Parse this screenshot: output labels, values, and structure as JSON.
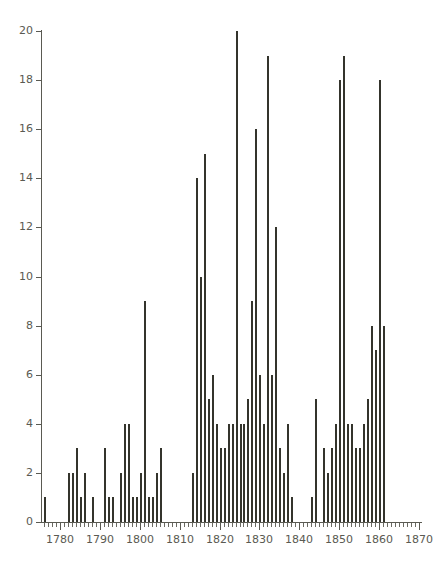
{
  "chart_data": {
    "type": "bar",
    "title": "",
    "subtitle": "",
    "xlabel": "",
    "ylabel": "",
    "xlim": [
      1775,
      1869
    ],
    "ylim": [
      0,
      20
    ],
    "grid": false,
    "legend": null,
    "bar_color": "#34342c",
    "axis_color": "#5a5a52",
    "background": "#ffffff",
    "x_tick_labels": [
      "1780",
      "1790",
      "1800",
      "1810",
      "1820",
      "1830",
      "1840",
      "1850",
      "1860",
      "1870"
    ],
    "x_tick_values": [
      1780,
      1790,
      1800,
      1810,
      1820,
      1830,
      1840,
      1850,
      1860,
      1870
    ],
    "x_minor_tick_step": 1,
    "y_tick_labels": [
      "0",
      "2",
      "4",
      "6",
      "8",
      "10",
      "12",
      "14",
      "16",
      "18",
      "20"
    ],
    "y_tick_values": [
      0,
      2,
      4,
      6,
      8,
      10,
      12,
      14,
      16,
      18,
      20
    ],
    "categories": [
      1776,
      1777,
      1778,
      1779,
      1780,
      1781,
      1782,
      1783,
      1784,
      1785,
      1786,
      1787,
      1788,
      1789,
      1790,
      1791,
      1792,
      1793,
      1794,
      1795,
      1796,
      1797,
      1798,
      1799,
      1800,
      1801,
      1802,
      1803,
      1804,
      1805,
      1806,
      1807,
      1808,
      1809,
      1810,
      1811,
      1812,
      1813,
      1814,
      1815,
      1816,
      1817,
      1818,
      1819,
      1820,
      1821,
      1822,
      1823,
      1824,
      1825,
      1826,
      1827,
      1828,
      1829,
      1830,
      1831,
      1832,
      1833,
      1834,
      1835,
      1836,
      1837,
      1838,
      1839,
      1840,
      1841,
      1842,
      1843,
      1844,
      1845,
      1846,
      1847,
      1848,
      1849,
      1850,
      1851,
      1852,
      1853,
      1854,
      1855,
      1856,
      1857,
      1858,
      1859,
      1860,
      1861,
      1862,
      1863,
      1864,
      1865,
      1866,
      1867
    ],
    "values": [
      1,
      0,
      0,
      0,
      0,
      0,
      2,
      2,
      3,
      1,
      2,
      0,
      1,
      0,
      0,
      3,
      1,
      1,
      0,
      2,
      4,
      4,
      1,
      1,
      2,
      9,
      1,
      1,
      2,
      3,
      0,
      0,
      0,
      0,
      0,
      0,
      0,
      2,
      14,
      10,
      15,
      5,
      6,
      4,
      3,
      3,
      4,
      4,
      20,
      4,
      4,
      5,
      9,
      16,
      6,
      4,
      19,
      6,
      12,
      3,
      2,
      4,
      1,
      0,
      0,
      0,
      0,
      1,
      5,
      0,
      3,
      2,
      3,
      4,
      18,
      19,
      4,
      4,
      3,
      3,
      4,
      5,
      8,
      7,
      18,
      8,
      0,
      0,
      0,
      0,
      0,
      0
    ],
    "series": [
      {
        "name": "count",
        "values": [
          1,
          0,
          0,
          0,
          0,
          0,
          2,
          2,
          3,
          1,
          2,
          0,
          1,
          0,
          0,
          3,
          1,
          1,
          0,
          2,
          4,
          4,
          1,
          1,
          2,
          9,
          1,
          1,
          2,
          3,
          0,
          0,
          0,
          0,
          0,
          0,
          0,
          2,
          14,
          10,
          15,
          5,
          6,
          4,
          3,
          3,
          4,
          4,
          20,
          4,
          4,
          5,
          9,
          16,
          6,
          4,
          19,
          6,
          12,
          3,
          2,
          4,
          1,
          0,
          0,
          0,
          0,
          1,
          5,
          0,
          3,
          2,
          3,
          4,
          18,
          19,
          4,
          4,
          3,
          3,
          4,
          5,
          8,
          7,
          18,
          8,
          0,
          0,
          0,
          0,
          0,
          0
        ]
      }
    ]
  }
}
